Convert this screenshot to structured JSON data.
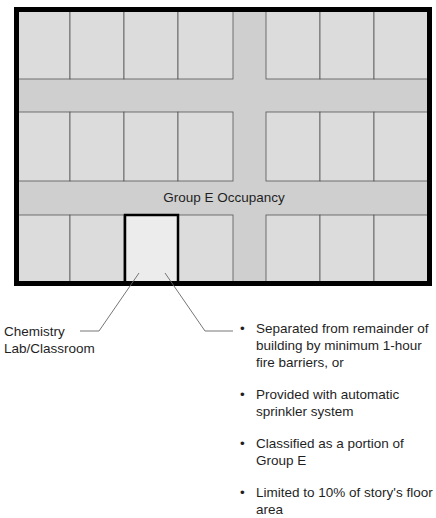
{
  "diagram": {
    "occupancy_label": "Group E Occupancy",
    "room_label_line1": "Chemistry",
    "room_label_line2": "Lab/Classroom",
    "requirements": [
      {
        "bullet": "•",
        "text": "Separated from remainder of building by minimum 1-hour fire barriers, or"
      },
      {
        "bullet": "•",
        "text": "Provided with automatic sprinkler system"
      },
      {
        "bullet": "•",
        "text": "Classified as a portion of Group E"
      },
      {
        "bullet": "•",
        "text": "Limited to 10% of story's floor area"
      }
    ],
    "colors": {
      "outer_wall": "#000000",
      "room_fill": "#dcdcdc",
      "corridor_fill": "#cfcfcf",
      "interior_wall": "#555555",
      "lab_fill": "#ececec",
      "leader_line": "#666666"
    }
  }
}
